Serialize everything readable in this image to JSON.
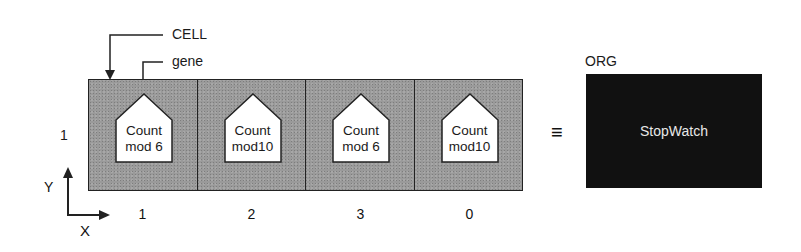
{
  "diagram": {
    "callouts": {
      "cell_label": "CELL",
      "gene_label": "gene"
    },
    "row_label": "1",
    "cells": [
      {
        "gene_line1": "Count",
        "gene_line2": "mod 6",
        "column_label": "1"
      },
      {
        "gene_line1": "Count",
        "gene_line2": "mod10",
        "column_label": "2"
      },
      {
        "gene_line1": "Count",
        "gene_line2": "mod 6",
        "column_label": "3"
      },
      {
        "gene_line1": "Count",
        "gene_line2": "mod10",
        "column_label": "0"
      }
    ],
    "equivalence_symbol": "≡",
    "organism": {
      "label": "ORG",
      "name": "StopWatch"
    },
    "axes": {
      "x_label": "X",
      "y_label": "Y"
    },
    "colors": {
      "cell_fill": "#9a9a9a",
      "gene_fill": "#ffffff",
      "org_fill": "#111111",
      "org_text": "#e8e8e8",
      "stroke": "#222222"
    }
  }
}
